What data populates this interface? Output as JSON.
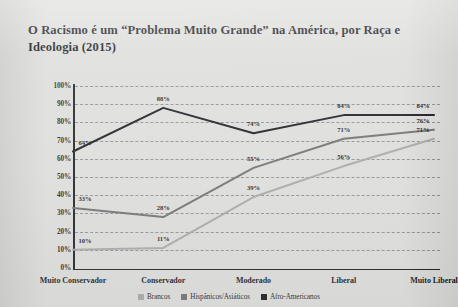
{
  "title": "O Racismo é um “Problema Muito Grande” na América, por Raça e Ideologia (2015)",
  "chart_data": {
    "type": "line",
    "title": "O Racismo é um “Problema Muito Grande” na América, por Raça e Ideologia (2015)",
    "xlabel": "",
    "ylabel": "",
    "ylim": [
      0,
      100
    ],
    "yticks": [
      "0%",
      "10%",
      "20%",
      "30%",
      "40%",
      "50%",
      "60%",
      "70%",
      "80%",
      "90%",
      "100%"
    ],
    "ytick_values": [
      0,
      10,
      20,
      30,
      40,
      50,
      60,
      70,
      80,
      90,
      100
    ],
    "grid": true,
    "legend_position": "bottom",
    "categories": [
      "Muito Conservador",
      "Conservador",
      "Moderado",
      "Liberal",
      "Muito Liberal"
    ],
    "series": [
      {
        "name": "Brancos",
        "color": "#a6a6a6",
        "values": [
          10,
          11,
          39,
          56,
          71
        ],
        "labels": [
          "10%",
          "11%",
          "39%",
          "56%",
          "71%"
        ]
      },
      {
        "name": "Hispânicos/Asiáticos",
        "color": "#6e6e6e",
        "values": [
          33,
          28,
          55,
          71,
          76
        ],
        "labels": [
          "33%",
          "28%",
          "55%",
          "71%",
          "76%"
        ]
      },
      {
        "name": "Afro-Americanos",
        "color": "#16171b",
        "values": [
          64,
          88,
          74,
          84,
          84
        ],
        "labels": [
          "64%",
          "88%",
          "74%",
          "84%",
          "84%"
        ]
      }
    ]
  }
}
